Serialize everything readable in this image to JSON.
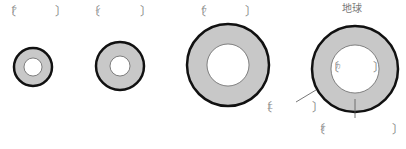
{
  "title_label": "地球",
  "answer_boxes": [
    {
      "id": "a",
      "tag": "ア"
    },
    {
      "id": "i",
      "tag": "イ"
    },
    {
      "id": "u",
      "tag": "ウ"
    },
    {
      "id": "e",
      "tag": "エ"
    },
    {
      "id": "o",
      "tag": "オ"
    },
    {
      "id": "ka",
      "tag": "カ"
    }
  ],
  "bracket_open": "〔",
  "bracket_close": "〕",
  "circles": [
    {
      "name": "planet-a",
      "cx": 33,
      "cy": 67,
      "outer_r": 19,
      "inner_r": 9
    },
    {
      "name": "planet-i",
      "cx": 120,
      "cy": 66,
      "outer_r": 24,
      "inner_r": 10
    },
    {
      "name": "planet-u",
      "cx": 228,
      "cy": 65,
      "outer_r": 41,
      "inner_r": 21
    },
    {
      "name": "earth",
      "cx": 355,
      "cy": 69,
      "outer_r": 43,
      "inner_r": 24
    }
  ],
  "colors": {
    "ring_fill": "#c8c8c8",
    "outline": "#111111",
    "inner": "#ffffff",
    "text": "#777777"
  }
}
